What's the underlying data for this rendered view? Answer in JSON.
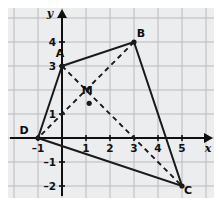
{
  "figure": {
    "background_color": "#ecedee",
    "page_background_color": "#ffffff",
    "grid_color": "#b9babd",
    "axis_color": "#101010",
    "shape_color": "#1a1a1a",
    "diagonal_color": "#1a1a1a",
    "axis_labels": {
      "x": "x",
      "y": "y"
    },
    "x_ticks": [
      {
        "value": -1,
        "label": "–1"
      },
      {
        "value": 1,
        "label": "1"
      },
      {
        "value": 2,
        "label": "2"
      },
      {
        "value": 3,
        "label": "3"
      },
      {
        "value": 4,
        "label": "4"
      },
      {
        "value": 5,
        "label": "5"
      }
    ],
    "y_ticks": [
      {
        "value": 4,
        "label": "4"
      },
      {
        "value": 3,
        "label": "3"
      },
      {
        "value": 1,
        "label": "1"
      },
      {
        "value": -1,
        "label": "–1"
      },
      {
        "value": -2,
        "label": "–2"
      }
    ]
  },
  "chart_data": {
    "type": "scatter",
    "xlabel": "x",
    "ylabel": "y",
    "xlim": [
      -1.6,
      6.2
    ],
    "ylim": [
      -2.6,
      4.6
    ],
    "grid": true,
    "grid_step": 1,
    "legend": "none",
    "points": [
      {
        "name": "A",
        "label": "A",
        "x": 0,
        "y": 3,
        "label_dx": -2,
        "label_dy": -9
      },
      {
        "name": "B",
        "label": "B",
        "x": 3,
        "y": 4,
        "label_dx": 7,
        "label_dy": -5
      },
      {
        "name": "C",
        "label": "C",
        "x": 5,
        "y": -2,
        "label_dx": 6,
        "label_dy": 8
      },
      {
        "name": "D",
        "label": "D",
        "x": -1,
        "y": 0,
        "label_dx": -14,
        "label_dy": -4
      },
      {
        "name": "M",
        "label": "M",
        "x": 1.133,
        "y": 1.444,
        "label_dx": -2,
        "label_dy": -9
      }
    ],
    "polygon": {
      "name": "quadrilateral-ABCD",
      "vertices": [
        "A",
        "B",
        "C",
        "D"
      ],
      "closed": true,
      "style": "solid"
    },
    "segments": [
      {
        "name": "diagonal-AC",
        "from": "A",
        "to": "C",
        "style": "dashed"
      },
      {
        "name": "diagonal-BD",
        "from": "B",
        "to": "D",
        "style": "dashed"
      }
    ]
  }
}
